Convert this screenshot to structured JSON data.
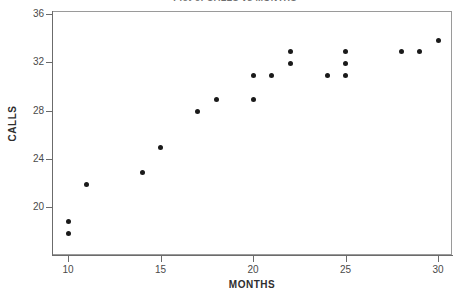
{
  "chart_data": {
    "type": "scatter",
    "title": "Plot of CALLS vs MONTHS",
    "xlabel": "MONTHS",
    "ylabel": "CALLS",
    "xlim": [
      8.7,
      31.0
    ],
    "ylim": [
      16.0,
      36.0
    ],
    "grid": false,
    "legend": null,
    "xticks": [
      10,
      15,
      20,
      25,
      30
    ],
    "xticklabels": [
      "10",
      "15",
      "20",
      "25",
      "30"
    ],
    "yticks": [
      20,
      24,
      28,
      32,
      36
    ],
    "yticklabels": [
      "20",
      "24",
      "28",
      "32",
      "36"
    ],
    "marker": "filled-circle",
    "marker_color": "#1a1a1a",
    "points": [
      {
        "x": 10,
        "y": 18.8
      },
      {
        "x": 10,
        "y": 17.8
      },
      {
        "x": 11,
        "y": 21.9
      },
      {
        "x": 14,
        "y": 22.9
      },
      {
        "x": 15,
        "y": 24.9
      },
      {
        "x": 17,
        "y": 27.9
      },
      {
        "x": 18,
        "y": 28.9
      },
      {
        "x": 20,
        "y": 30.9
      },
      {
        "x": 20,
        "y": 28.9
      },
      {
        "x": 21,
        "y": 30.9
      },
      {
        "x": 22,
        "y": 32.9
      },
      {
        "x": 22,
        "y": 31.9
      },
      {
        "x": 24,
        "y": 30.9
      },
      {
        "x": 25,
        "y": 32.9
      },
      {
        "x": 25,
        "y": 31.9
      },
      {
        "x": 25,
        "y": 30.9
      },
      {
        "x": 28,
        "y": 32.9
      },
      {
        "x": 29,
        "y": 32.9
      },
      {
        "x": 30,
        "y": 33.8
      }
    ]
  }
}
